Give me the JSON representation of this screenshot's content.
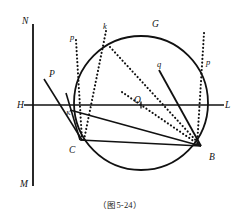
{
  "figure": {
    "caption": "（图5-24）",
    "background_color": "#ffffff",
    "stroke_color": "#111111",
    "labels": [
      {
        "id": "N",
        "text": "N",
        "x": 22,
        "y": 17,
        "size": "normal"
      },
      {
        "id": "M",
        "text": "M",
        "x": 20,
        "y": 180,
        "size": "normal"
      },
      {
        "id": "H",
        "text": "H",
        "x": 17,
        "y": 101,
        "size": "normal"
      },
      {
        "id": "L",
        "text": "L",
        "x": 225,
        "y": 101,
        "size": "normal"
      },
      {
        "id": "O",
        "text": "O",
        "x": 134,
        "y": 96,
        "size": "normal"
      },
      {
        "id": "G",
        "text": "G",
        "x": 152,
        "y": 20,
        "size": "normal"
      },
      {
        "id": "B",
        "text": "B",
        "x": 209,
        "y": 153,
        "size": "normal"
      },
      {
        "id": "C",
        "text": "C",
        "x": 69,
        "y": 146,
        "size": "normal"
      },
      {
        "id": "K",
        "text": "K",
        "x": 66,
        "y": 110,
        "size": "tiny"
      },
      {
        "id": "P",
        "text": "P",
        "x": 49,
        "y": 70,
        "size": "normal"
      },
      {
        "id": "p-left",
        "text": "p",
        "x": 70,
        "y": 33,
        "size": "small"
      },
      {
        "id": "p-right",
        "text": "p",
        "x": 206,
        "y": 58,
        "size": "small"
      },
      {
        "id": "k",
        "text": "k",
        "x": 103,
        "y": 22,
        "size": "small"
      },
      {
        "id": "q",
        "text": "q",
        "x": 157,
        "y": 60,
        "size": "small"
      }
    ],
    "circle": {
      "cx": 141,
      "cy": 103,
      "r": 67
    },
    "points": {
      "H": {
        "x": 30,
        "y": 105
      },
      "L": {
        "x": 220,
        "y": 105
      },
      "N": {
        "x": 33,
        "y": 24
      },
      "M": {
        "x": 33,
        "y": 186
      },
      "O": {
        "x": 141,
        "y": 105
      },
      "B": {
        "x": 201,
        "y": 146
      },
      "C": {
        "x": 80,
        "y": 138
      },
      "K": {
        "x": 74,
        "y": 105
      },
      "T": {
        "x": 110,
        "y": 47
      },
      "Ptail": {
        "x": 44,
        "y": 79
      },
      "qtail": {
        "x": 159,
        "y": 70
      }
    },
    "solid_segments": [
      {
        "name": "axis-vertical-NM",
        "x1": 33,
        "y1": 24,
        "x2": 33,
        "y2": 186,
        "w": 1.8
      },
      {
        "name": "axis-horizontal-HL",
        "x1": 24,
        "y1": 105,
        "x2": 224,
        "y2": 105,
        "w": 1.4
      },
      {
        "name": "chord-C-B",
        "x1": 80,
        "y1": 140,
        "x2": 201,
        "y2": 146,
        "w": 1.6
      },
      {
        "name": "chord-K-B",
        "x1": 70,
        "y1": 110,
        "x2": 201,
        "y2": 146,
        "w": 1.6
      },
      {
        "name": "segment-P-C",
        "x1": 44,
        "y1": 79,
        "x2": 82,
        "y2": 140,
        "w": 1.6
      },
      {
        "name": "segment-arc-tangent",
        "x1": 66,
        "y1": 93,
        "x2": 80,
        "y2": 140,
        "w": 1.6
      },
      {
        "name": "segment-q-B",
        "x1": 159,
        "y1": 70,
        "x2": 201,
        "y2": 146,
        "w": 1.8
      }
    ],
    "dotted_segments": [
      {
        "name": "dotted-p-left",
        "x1": 76,
        "y1": 40,
        "x2": 82,
        "y2": 140
      },
      {
        "name": "dotted-k-to-C",
        "x1": 106,
        "y1": 31,
        "x2": 84,
        "y2": 140
      },
      {
        "name": "dotted-T-to-B",
        "x1": 110,
        "y1": 47,
        "x2": 201,
        "y2": 146
      },
      {
        "name": "dotted-O-to-B",
        "x1": 122,
        "y1": 92,
        "x2": 201,
        "y2": 146
      },
      {
        "name": "dotted-p-right",
        "x1": 204,
        "y1": 33,
        "x2": 197,
        "y2": 146
      }
    ],
    "tick_marks": [
      {
        "name": "center-tick-O",
        "x": 141,
        "y": 105,
        "len": 7
      }
    ]
  }
}
